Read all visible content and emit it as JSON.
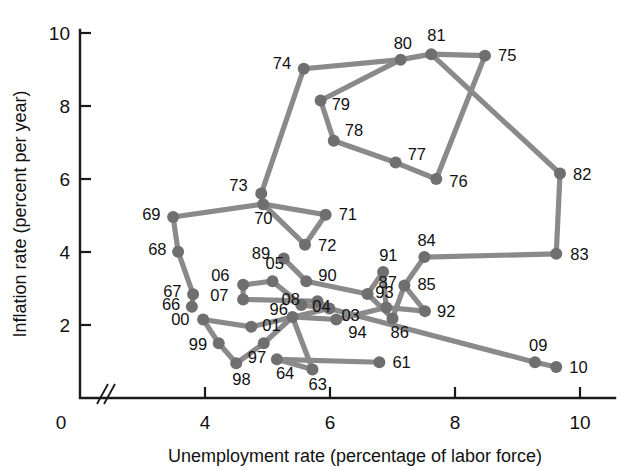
{
  "chart_data": {
    "type": "scatter",
    "title": "",
    "subtitle": "",
    "xlabel": "Unemployment rate (percentage of labor force)",
    "ylabel": "Inflation rate (percent per year)",
    "xlim": [
      3.2,
      10.6
    ],
    "ylim": [
      0,
      10.6
    ],
    "xticks": [
      4,
      6,
      8,
      10
    ],
    "yticks": [
      2,
      4,
      6,
      8,
      10
    ],
    "x_origin_label": "0",
    "y_origin_label": "0",
    "axis_break": true,
    "grid": false,
    "legend": "none",
    "line_color": "#8a8a8a",
    "point_color": "#6f6f6f",
    "axis_color": "#1a1a1a",
    "series": [
      {
        "name": "US Phillips curve path 1961-2010",
        "points": [
          {
            "label": "61",
            "x": 6.79,
            "y": 0.98,
            "lx": 13,
            "ly": 6
          },
          {
            "label": "63",
            "x": 5.72,
            "y": 0.78,
            "lx": -4,
            "ly": 20
          },
          {
            "label": "64",
            "x": 5.15,
            "y": 1.06,
            "lx": -1,
            "ly": 20
          },
          {
            "label": "66",
            "x": 3.79,
            "y": 2.5,
            "lx": -30,
            "ly": 3
          },
          {
            "label": "67",
            "x": 3.81,
            "y": 2.84,
            "lx": -30,
            "ly": 3
          },
          {
            "label": "68",
            "x": 3.57,
            "y": 4.01,
            "lx": -30,
            "ly": 3
          },
          {
            "label": "69",
            "x": 3.49,
            "y": 4.96,
            "lx": -31,
            "ly": 3
          },
          {
            "label": "70",
            "x": 4.93,
            "y": 5.31,
            "lx": -9,
            "ly": 20
          },
          {
            "label": "71",
            "x": 5.93,
            "y": 5.02,
            "lx": 13,
            "ly": 5
          },
          {
            "label": "72",
            "x": 5.6,
            "y": 4.2,
            "lx": 13,
            "ly": 6
          },
          {
            "label": "73",
            "x": 4.9,
            "y": 5.6,
            "lx": -32,
            "ly": -3
          },
          {
            "label": "74",
            "x": 5.58,
            "y": 9.02,
            "lx": -31,
            "ly": 0
          },
          {
            "label": "75",
            "x": 8.48,
            "y": 9.38,
            "lx": 13,
            "ly": 5
          },
          {
            "label": "76",
            "x": 7.7,
            "y": 6.0,
            "lx": 13,
            "ly": 8
          },
          {
            "label": "77",
            "x": 7.05,
            "y": 6.45,
            "lx": 12,
            "ly": -3
          },
          {
            "label": "78",
            "x": 6.06,
            "y": 7.05,
            "lx": 11,
            "ly": -5
          },
          {
            "label": "79",
            "x": 5.85,
            "y": 8.15,
            "lx": 11,
            "ly": 9
          },
          {
            "label": "80",
            "x": 7.13,
            "y": 9.27,
            "lx": -7,
            "ly": -11
          },
          {
            "label": "81",
            "x": 7.62,
            "y": 9.42,
            "lx": -4,
            "ly": -13
          },
          {
            "label": "82",
            "x": 9.68,
            "y": 6.15,
            "lx": 13,
            "ly": 6
          },
          {
            "label": "83",
            "x": 9.62,
            "y": 3.95,
            "lx": 14,
            "ly": 6
          },
          {
            "label": "84",
            "x": 7.51,
            "y": 3.86,
            "lx": -7,
            "ly": -11
          },
          {
            "label": "85",
            "x": 7.19,
            "y": 3.08,
            "lx": 13,
            "ly": 4
          },
          {
            "label": "86",
            "x": 7.0,
            "y": 2.18,
            "lx": -2,
            "ly": 20
          },
          {
            "label": "87",
            "x": 6.6,
            "y": 2.85,
            "lx": 11,
            "ly": -6
          },
          {
            "label": "89",
            "x": 5.26,
            "y": 3.82,
            "lx": -32,
            "ly": 0
          },
          {
            "label": "90",
            "x": 5.62,
            "y": 3.2,
            "lx": 12,
            "ly": 0
          },
          {
            "label": "91",
            "x": 6.85,
            "y": 3.45,
            "lx": -4,
            "ly": -11
          },
          {
            "label": "92",
            "x": 7.52,
            "y": 2.38,
            "lx": 12,
            "ly": 6
          },
          {
            "label": "93",
            "x": 6.9,
            "y": 2.48,
            "lx": -11,
            "ly": -9
          },
          {
            "label": "94",
            "x": 6.1,
            "y": 2.15,
            "lx": 12,
            "ly": 18
          },
          {
            "label": "96",
            "x": 5.4,
            "y": 2.22,
            "lx": -23,
            "ly": -2
          },
          {
            "label": "97",
            "x": 4.94,
            "y": 1.5,
            "lx": -16,
            "ly": 20
          },
          {
            "label": "98",
            "x": 4.5,
            "y": 0.95,
            "lx": -4,
            "ly": 22
          },
          {
            "label": "99",
            "x": 4.22,
            "y": 1.5,
            "lx": -30,
            "ly": 7
          },
          {
            "label": "00",
            "x": 3.97,
            "y": 2.15,
            "lx": -32,
            "ly": 5
          },
          {
            "label": "01",
            "x": 4.74,
            "y": 1.95,
            "lx": 11,
            "ly": 4
          },
          {
            "label": "03",
            "x": 5.99,
            "y": 2.45,
            "lx": 12,
            "ly": 12
          },
          {
            "label": "04",
            "x": 5.54,
            "y": 2.55,
            "lx": 11,
            "ly": 7
          },
          {
            "label": "05",
            "x": 5.08,
            "y": 3.2,
            "lx": -7,
            "ly": -12
          },
          {
            "label": "06",
            "x": 4.61,
            "y": 3.1,
            "lx": -32,
            "ly": -4
          },
          {
            "label": "07",
            "x": 4.61,
            "y": 2.7,
            "lx": -33,
            "ly": 2
          },
          {
            "label": "08",
            "x": 5.8,
            "y": 2.65,
            "lx": -36,
            "ly": 4
          },
          {
            "label": "09",
            "x": 9.28,
            "y": 0.98,
            "lx": -6,
            "ly": -11
          },
          {
            "label": "10",
            "x": 9.62,
            "y": 0.85,
            "lx": 13,
            "ly": 6
          }
        ],
        "path_order": [
          "61",
          "63",
          "64",
          "66",
          "67",
          "68",
          "69",
          "70",
          "73",
          "74",
          "75",
          "76",
          "77",
          "78",
          "79",
          "80",
          "81",
          "82",
          "83",
          "84",
          "85",
          "86",
          "87",
          "89",
          "90",
          "91",
          "92",
          "93",
          "94",
          "96",
          "97",
          "98",
          "99",
          "00",
          "01",
          "03",
          "04",
          "05",
          "06",
          "07",
          "08",
          "09",
          "10",
          "71",
          "72"
        ]
      }
    ],
    "connections": [
      [
        "61",
        "64"
      ],
      [
        "64",
        "63"
      ],
      [
        "63",
        "96"
      ],
      [
        "66",
        "67"
      ],
      [
        "67",
        "68"
      ],
      [
        "68",
        "69"
      ],
      [
        "69",
        "70"
      ],
      [
        "70",
        "73"
      ],
      [
        "70",
        "71"
      ],
      [
        "71",
        "72"
      ],
      [
        "72",
        "70"
      ],
      [
        "73",
        "74"
      ],
      [
        "74",
        "80"
      ],
      [
        "80",
        "81"
      ],
      [
        "81",
        "75"
      ],
      [
        "75",
        "76"
      ],
      [
        "76",
        "77"
      ],
      [
        "77",
        "78"
      ],
      [
        "78",
        "79"
      ],
      [
        "79",
        "80"
      ],
      [
        "81",
        "82"
      ],
      [
        "82",
        "83"
      ],
      [
        "83",
        "84"
      ],
      [
        "84",
        "85"
      ],
      [
        "85",
        "86"
      ],
      [
        "85",
        "92"
      ],
      [
        "86",
        "87"
      ],
      [
        "87",
        "91"
      ],
      [
        "91",
        "93"
      ],
      [
        "93",
        "92"
      ],
      [
        "93",
        "94"
      ],
      [
        "94",
        "96"
      ],
      [
        "96",
        "97"
      ],
      [
        "97",
        "98"
      ],
      [
        "98",
        "99"
      ],
      [
        "99",
        "00"
      ],
      [
        "00",
        "01"
      ],
      [
        "01",
        "03"
      ],
      [
        "03",
        "04"
      ],
      [
        "04",
        "05"
      ],
      [
        "05",
        "06"
      ],
      [
        "06",
        "07"
      ],
      [
        "07",
        "08"
      ],
      [
        "08",
        "03"
      ],
      [
        "89",
        "90"
      ],
      [
        "90",
        "87"
      ],
      [
        "03",
        "09"
      ],
      [
        "09",
        "10"
      ]
    ]
  },
  "axes": {
    "x_title": "Unemployment rate (percentage of labor force)",
    "y_title": "Inflation rate (percent per year)",
    "x_zero": "0",
    "y_zero": "0",
    "x_tick_labels": [
      "4",
      "6",
      "8",
      "10"
    ],
    "y_tick_labels": [
      "2",
      "4",
      "6",
      "8",
      "10"
    ]
  }
}
